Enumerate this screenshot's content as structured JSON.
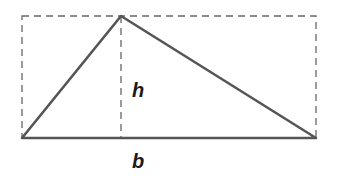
{
  "diagram": {
    "title": "",
    "labels": {
      "height": "h",
      "base": "b"
    },
    "colors": {
      "stroke": "#555555",
      "dashed": "#666666",
      "text": "#1a1a1a",
      "background": "#ffffff"
    },
    "shapes": {
      "bounding_rectangle": {
        "x": 22,
        "y": 16,
        "width": 294,
        "height": 122,
        "style": "dashed"
      },
      "triangle": {
        "points": [
          [
            22,
            138
          ],
          [
            121,
            16
          ],
          [
            316,
            138
          ]
        ],
        "style": "solid"
      },
      "height_line": {
        "x1": 121,
        "y1": 16,
        "x2": 121,
        "y2": 138,
        "style": "dashed"
      }
    }
  }
}
